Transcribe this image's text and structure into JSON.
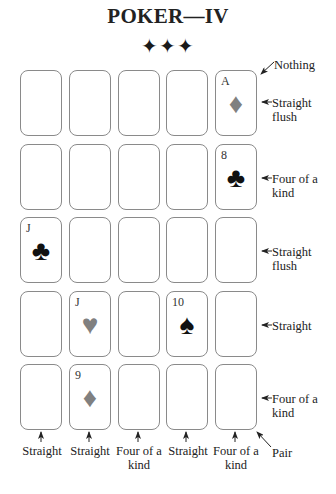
{
  "title": "POKER—IV",
  "ornament": "✦✦✦",
  "grid": {
    "rows": 5,
    "cols": 5,
    "cards": [
      {
        "row": 0,
        "col": 4,
        "rank": "A",
        "suit": "♦",
        "suit_name": "diamond",
        "color": "red"
      },
      {
        "row": 1,
        "col": 4,
        "rank": "8",
        "suit": "♣",
        "suit_name": "club",
        "color": "black"
      },
      {
        "row": 2,
        "col": 0,
        "rank": "J",
        "suit": "♣",
        "suit_name": "club",
        "color": "black"
      },
      {
        "row": 3,
        "col": 1,
        "rank": "J",
        "suit": "♥",
        "suit_name": "heart",
        "color": "red"
      },
      {
        "row": 3,
        "col": 3,
        "rank": "10",
        "suit": "♠",
        "suit_name": "spade",
        "color": "black"
      },
      {
        "row": 4,
        "col": 1,
        "rank": "9",
        "suit": "♦",
        "suit_name": "diamond",
        "color": "red"
      }
    ]
  },
  "row_labels": [
    "Straight flush",
    "Four of a kind",
    "Straight flush",
    "Straight",
    "Four of a kind"
  ],
  "column_labels": [
    "Straight",
    "Straight",
    "Four of a kind",
    "Straight",
    "Four of a kind"
  ],
  "diagonal_labels": {
    "top_right": "Nothing",
    "bottom_right": "Pair"
  },
  "colors": {
    "red_suit": "#808080",
    "black_suit": "#111111",
    "card_border": "#8a8a8a"
  }
}
